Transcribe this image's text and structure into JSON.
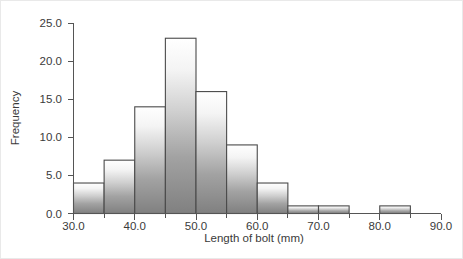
{
  "chart_data": {
    "type": "bar",
    "title": "",
    "subtitle": "",
    "xlabel": "Length of bolt (mm)",
    "ylabel": "Frequency",
    "xlim": [
      30.0,
      90.0
    ],
    "ylim": [
      0.0,
      25.0
    ],
    "grid": false,
    "legend": null,
    "bin_width": 5,
    "bin_edges": [
      30,
      35,
      40,
      45,
      50,
      55,
      60,
      65,
      70,
      75,
      80,
      85
    ],
    "categories": [
      "30-35",
      "35-40",
      "40-45",
      "45-50",
      "50-55",
      "55-60",
      "60-65",
      "65-70",
      "70-75",
      "75-80",
      "80-85"
    ],
    "values": [
      4,
      7,
      14,
      23,
      16,
      9,
      4,
      1,
      1,
      0,
      1
    ],
    "xticks": [
      30.0,
      35.0,
      40.0,
      45.0,
      50.0,
      55.0,
      60.0,
      65.0,
      70.0,
      75.0,
      80.0,
      85.0,
      90.0
    ],
    "xtick_labels": [
      "30.0",
      "",
      "40.0",
      "",
      "50.0",
      "",
      "60.0",
      "",
      "70.0",
      "",
      "80.0",
      "",
      "90.0"
    ],
    "yticks": [
      0.0,
      5.0,
      10.0,
      15.0,
      20.0,
      25.0
    ],
    "ytick_labels": [
      "0.0",
      "5.0",
      "10.0",
      "15.0",
      "20.0",
      "25.0"
    ],
    "colors": {
      "bar_fill_top": "#ffffff",
      "bar_fill_bottom": "#808080",
      "bar_edge": "#4a4a4a",
      "axis": "#555555",
      "text": "#3a3a3a",
      "background": "#ffffff"
    }
  }
}
